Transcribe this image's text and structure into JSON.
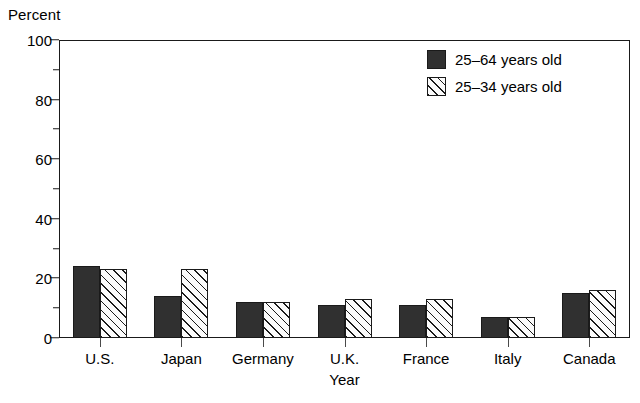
{
  "chart_data": {
    "type": "bar",
    "title": "",
    "subtitle": "",
    "xlabel": "Year",
    "ylabel": "Percent",
    "ylim": [
      0,
      100
    ],
    "grid": false,
    "legend_position": "top-right",
    "categories": [
      "U.S.",
      "Japan",
      "Germany",
      "U.K.",
      "France",
      "Italy",
      "Canada"
    ],
    "series": [
      {
        "name": "25–64 years old",
        "fill": "solid-dark",
        "color": "#303030",
        "values": [
          24,
          14,
          12,
          11,
          11,
          7,
          15
        ]
      },
      {
        "name": "25–34 years old",
        "fill": "diagonal-hatch",
        "color": "#fbfbfb",
        "values": [
          23,
          23,
          12,
          13,
          13,
          7,
          16
        ]
      }
    ],
    "y_ticks_major": [
      0,
      20,
      40,
      60,
      80,
      100
    ],
    "y_ticks_minor": [
      10,
      30,
      50,
      70,
      90
    ],
    "y_tick_labels": [
      "0",
      "20",
      "40",
      "60",
      "80",
      "100"
    ]
  },
  "axes": {
    "y_unit_label": "Percent",
    "x_axis_title": "Year"
  },
  "legend": {
    "entries": [
      {
        "label": "25–64 years old"
      },
      {
        "label": "25–34 years old"
      }
    ]
  }
}
